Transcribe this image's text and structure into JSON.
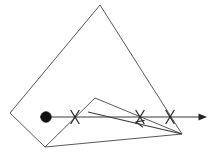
{
  "figure": {
    "canvas": {
      "width": 215,
      "height": 160,
      "background": "#ffffff"
    },
    "colors": {
      "polygon_stroke": "#59595c",
      "ray_stroke": "#3a3a3c",
      "marker_stroke": "#262628",
      "point_fill": "#111113",
      "background": "#ffffff"
    },
    "quadrilateral": {
      "label": "outer-quadrilateral",
      "points": "100,5 10,113 45,147 182,134",
      "vertices": [
        {
          "name": "apex-top",
          "x": 100,
          "y": 5
        },
        {
          "name": "vertex-left",
          "x": 10,
          "y": 113
        },
        {
          "name": "vertex-bottom",
          "x": 45,
          "y": 147
        },
        {
          "name": "vertex-bottom-right",
          "x": 182,
          "y": 134
        }
      ]
    },
    "inner_triangle": {
      "label": "inner-triangle",
      "points": "45,147 95,98 182,134",
      "vertices": [
        {
          "name": "tri-left",
          "x": 45,
          "y": 147
        },
        {
          "name": "tri-apex",
          "x": 95,
          "y": 98
        },
        {
          "name": "tri-right",
          "x": 182,
          "y": 134
        }
      ]
    },
    "ray": {
      "label": "horizontal-ray",
      "start_x": 40,
      "end_x": 199,
      "y": 117,
      "arrow_tip_x": 207,
      "direction": "right"
    },
    "chord": {
      "label": "descending-chord",
      "x1": 88,
      "y1": 112,
      "x2": 182,
      "y2": 134,
      "arrow_at": {
        "x": 136,
        "y": 122
      },
      "direction": "left"
    },
    "point": {
      "label": "filled-point",
      "x": 46,
      "y": 117,
      "radius": 5.4
    },
    "x_markers": [
      {
        "name": "x-marker-1",
        "x": 75,
        "y": 117,
        "size": 7
      },
      {
        "name": "x-marker-2",
        "x": 140,
        "y": 117,
        "size": 7
      },
      {
        "name": "x-marker-3",
        "x": 170,
        "y": 117,
        "size": 7
      }
    ]
  }
}
